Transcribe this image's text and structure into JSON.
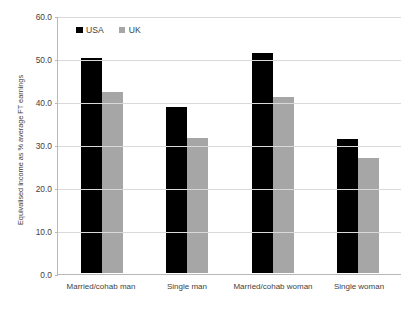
{
  "chart_data": {
    "type": "bar",
    "title": "",
    "xlabel": "",
    "ylabel": "Equivalised income as % average FT earnings",
    "ylim": [
      0,
      60
    ],
    "ytick_labels": [
      "0.0",
      "10.0",
      "20.0",
      "30.0",
      "40.0",
      "50.0",
      "60.0"
    ],
    "ytick_values": [
      0,
      10,
      20,
      30,
      40,
      50,
      60
    ],
    "grid": true,
    "legend_position": "top-left inside plot",
    "categories": [
      "Married/cohab man",
      "Single man",
      "Married/cohab woman",
      "Single woman"
    ],
    "series": [
      {
        "name": "USA",
        "color": "#000000",
        "values": [
          50.0,
          38.5,
          51.2,
          31.2
        ]
      },
      {
        "name": "UK",
        "color": "#a6a6a6",
        "values": [
          42.0,
          31.5,
          41.0,
          26.7
        ]
      }
    ]
  },
  "legend": {
    "items": [
      {
        "label": "USA",
        "color": "#000000"
      },
      {
        "label": "UK",
        "color": "#a6a6a6"
      }
    ]
  },
  "axes": {
    "y_title": "Equivalised income as % average FT earnings"
  },
  "colors": {
    "usa": "#000000",
    "uk": "#a6a6a6",
    "gridline": "#d9d9d9",
    "axis": "#b8b8b8",
    "text": "#3f3f3f",
    "background": "#ffffff"
  }
}
